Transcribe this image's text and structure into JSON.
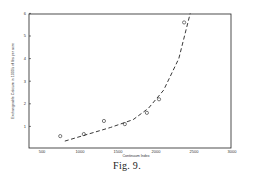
{
  "figure": {
    "caption": "Fig. 9."
  },
  "chart_data": {
    "type": "scatter",
    "title": "",
    "xlabel": "Continuum Index",
    "ylabel": "Exchangeable Calcium in 1000's of lbs per acre",
    "xlim": [
      340,
      3000
    ],
    "ylim": [
      0,
      6
    ],
    "x_ticks": [
      500,
      1000,
      1500,
      2000,
      2500,
      3000
    ],
    "y_ticks": [
      1,
      2,
      3,
      4,
      5,
      6
    ],
    "grid": false,
    "legend": null,
    "series": [
      {
        "name": "observed",
        "marker": "open-circle",
        "x": [
          740,
          1050,
          1315,
          1590,
          1880,
          2040,
          2370
        ],
        "y": [
          0.57,
          0.66,
          1.24,
          1.1,
          1.6,
          2.2,
          5.6
        ]
      },
      {
        "name": "fitted curve",
        "style": "dashed",
        "x": [
          800,
          1100,
          1400,
          1700,
          1900,
          2100,
          2300,
          2450
        ],
        "y": [
          0.35,
          0.65,
          0.95,
          1.3,
          1.8,
          2.6,
          4.0,
          6.0
        ]
      }
    ]
  }
}
